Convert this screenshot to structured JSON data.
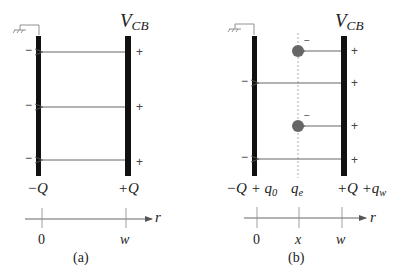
{
  "panels": [
    {
      "id": "a",
      "caption": "(a)",
      "voltage_label": "V",
      "voltage_sub": "CB",
      "left_charge": "−Q",
      "right_charge": "+Q",
      "left_signs": [
        "−",
        "−",
        "−"
      ],
      "right_signs": [
        "+",
        "+",
        "+"
      ],
      "axis": {
        "var": "r",
        "ticks": [
          "0",
          "w"
        ]
      }
    },
    {
      "id": "b",
      "caption": "(b)",
      "voltage_label": "V",
      "voltage_sub": "CB",
      "left_charge": "−Q + q",
      "left_charge_sub": "0",
      "middle_charge": "q",
      "middle_charge_sub": "e",
      "right_charge": "+Q +q",
      "right_charge_sub": "w",
      "left_signs": [
        "−",
        "−"
      ],
      "right_signs": [
        "+",
        "+",
        "+",
        "+"
      ],
      "electron_sign": "−",
      "axis": {
        "var": "r",
        "ticks": [
          "0",
          "x",
          "w"
        ]
      }
    }
  ],
  "colors": {
    "plate": "#111111",
    "field_line": "#555555",
    "electron": "#666666",
    "dashed": "#999999"
  }
}
